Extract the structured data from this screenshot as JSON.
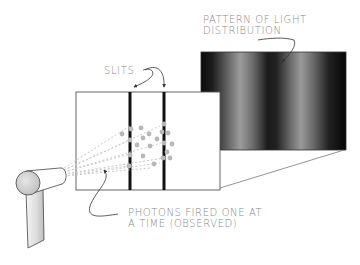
{
  "diagram": {
    "labels": {
      "pattern": {
        "line1": "PATTERN OF LIGHT",
        "line2": "DISTRIBUTION"
      },
      "slits": "SLITS",
      "photons": {
        "line1": "PHOTONS FIRED ONE AT",
        "line2": "A TIME (OBSERVED)"
      }
    },
    "components": [
      {
        "id": "photon-gun",
        "description": "cylindrical photon emitter on a stand, lower left"
      },
      {
        "id": "barrier",
        "description": "white rectangular barrier with two vertical black slits"
      },
      {
        "id": "detection-screen",
        "description": "dark screen showing two bright vertical bands"
      },
      {
        "id": "photon-paths",
        "description": "dashed grey lines fanning from gun to slits with grey dots"
      }
    ],
    "colors": {
      "label_text": "#8a8a8a",
      "slit": "#111111",
      "outline": "#555555",
      "photon_dots": "#b5b5b5",
      "screen_dark": "#0a0a0a",
      "screen_light": "#9a9a9a"
    }
  }
}
